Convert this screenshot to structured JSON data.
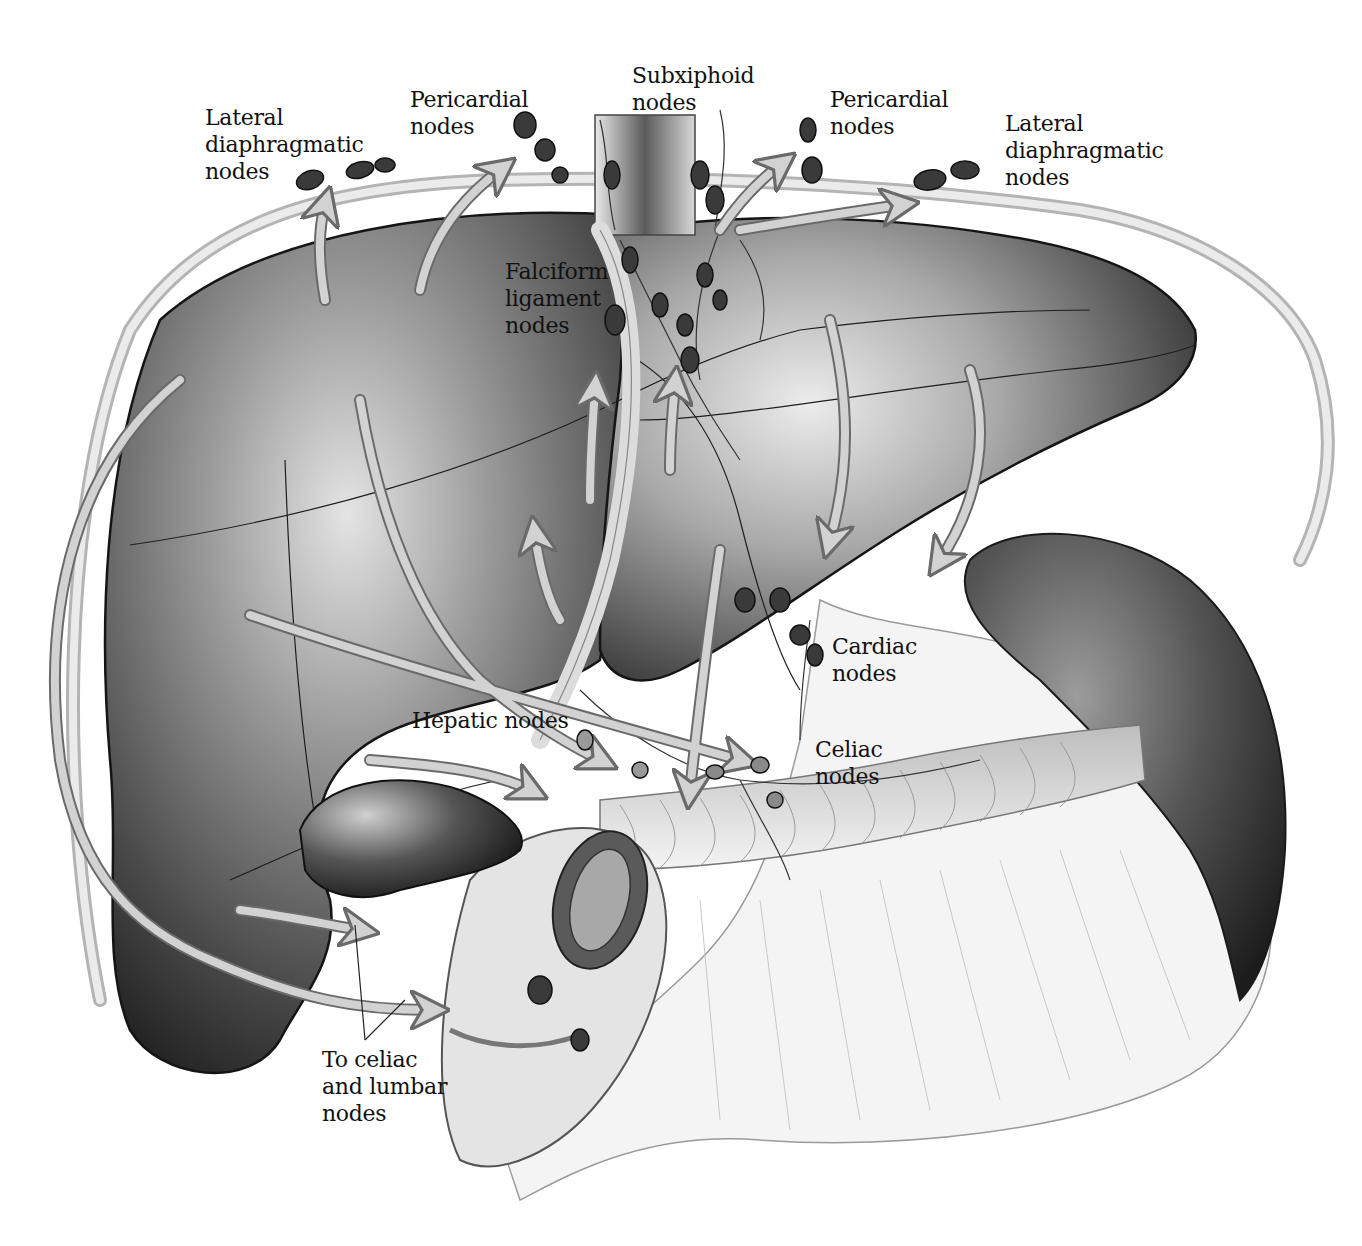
{
  "figure": {
    "palette": {
      "background": "#ffffff",
      "liver_dark": "#2a2a2a",
      "liver_mid": "#6e6e6e",
      "liver_light": "#d8d8d8",
      "arrow_fill": "#c9c9c9",
      "arrow_stroke": "#6a6a6a",
      "node_fill": "#3a3a3a",
      "label_text": "#111111"
    }
  },
  "labels": {
    "lateral_diaphragmatic_left": "Lateral\ndiaphragmatic\nnodes",
    "pericardial_left": "Pericardial\nnodes",
    "subxiphoid": "Subxiphoid\nnodes",
    "pericardial_right": "Pericardial\nnodes",
    "lateral_diaphragmatic_right": "Lateral\ndiaphragmatic\nnodes",
    "falciform_ligament": "Falciform\nligament\nnodes",
    "cardiac": "Cardiac\nnodes",
    "hepatic": "Hepatic nodes",
    "celiac": "Celiac\nnodes",
    "to_celiac_lumbar": "To celiac\nand lumbar\nnodes"
  },
  "structures": [
    "liver",
    "gallbladder",
    "diaphragm",
    "falciform-ligament",
    "stomach",
    "spleen",
    "duodenum",
    "pancreas",
    "inferior-vena-cava"
  ]
}
